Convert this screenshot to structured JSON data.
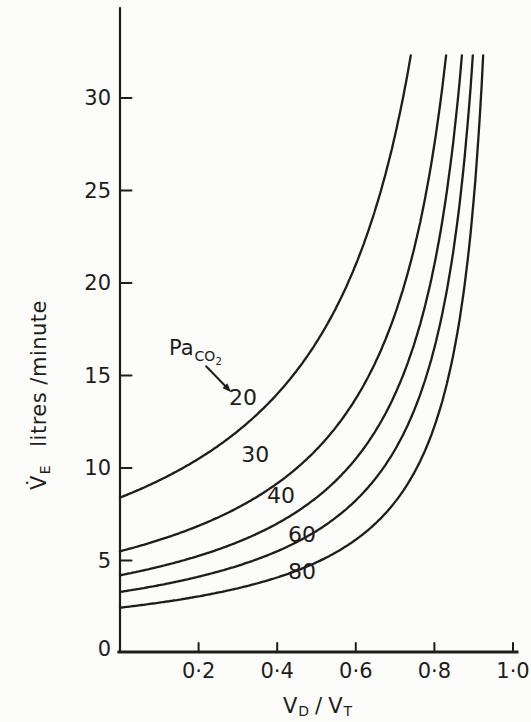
{
  "figure": {
    "background": "#fcfcfa",
    "ink_color": "#1d1d1b"
  },
  "chart_data": {
    "type": "line",
    "title": "",
    "ylabel": {
      "main": "V̇",
      "sub": "E",
      "rest": "litres /minute"
    },
    "xlabel": {
      "v1": "V",
      "sub1": "D",
      "sep": "/",
      "v2": "V",
      "sub2": "T"
    },
    "xlim": [
      0,
      1.01
    ],
    "ylim": [
      0,
      34.9
    ],
    "grid": false,
    "legend": "none",
    "origin_label": "0",
    "y_ticks": [
      {
        "v": 5,
        "label": "5"
      },
      {
        "v": 10,
        "label": "10"
      },
      {
        "v": 15,
        "label": "15"
      },
      {
        "v": 20,
        "label": "20"
      },
      {
        "v": 25,
        "label": "25"
      },
      {
        "v": 30,
        "label": "30"
      }
    ],
    "x_ticks": [
      {
        "v": 0.2,
        "label": "0·2"
      },
      {
        "v": 0.4,
        "label": "0·4"
      },
      {
        "v": 0.6,
        "label": "0·6"
      },
      {
        "v": 0.8,
        "label": "0·8"
      },
      {
        "v": 1.0,
        "label": "1·0"
      }
    ],
    "ve_max_drawn": 32.3,
    "model_note": "VE = VE0 / (1 - VD/VT); each curve clipped at ve_max_drawn",
    "series": [
      {
        "name": "PaCO2 20",
        "paco2": 20,
        "label": "20",
        "ve0": 8.4,
        "label_at": [
          0.313,
          13.8
        ],
        "points": [
          [
            0,
            8.4
          ],
          [
            0.1,
            9.3
          ],
          [
            0.2,
            10.5
          ],
          [
            0.3,
            12.0
          ],
          [
            0.4,
            14.0
          ],
          [
            0.5,
            16.8
          ],
          [
            0.6,
            21.0
          ],
          [
            0.7,
            28.0
          ],
          [
            0.74,
            32.3
          ]
        ]
      },
      {
        "name": "PaCO2 30",
        "paco2": 30,
        "label": "30",
        "ve0": 5.5,
        "label_at": [
          0.344,
          10.7
        ],
        "points": [
          [
            0,
            5.5
          ],
          [
            0.2,
            6.9
          ],
          [
            0.4,
            9.2
          ],
          [
            0.6,
            13.8
          ],
          [
            0.7,
            18.3
          ],
          [
            0.8,
            27.5
          ],
          [
            0.83,
            32.3
          ]
        ]
      },
      {
        "name": "PaCO2 40",
        "paco2": 40,
        "label": "40",
        "ve0": 4.2,
        "label_at": [
          0.41,
          8.5
        ],
        "points": [
          [
            0,
            4.2
          ],
          [
            0.2,
            5.3
          ],
          [
            0.4,
            7.0
          ],
          [
            0.6,
            10.5
          ],
          [
            0.7,
            14.0
          ],
          [
            0.8,
            21.0
          ],
          [
            0.87,
            32.3
          ]
        ]
      },
      {
        "name": "PaCO2 60",
        "paco2": 60,
        "label": "60",
        "ve0": 3.3,
        "label_at": [
          0.463,
          6.4
        ],
        "points": [
          [
            0,
            3.3
          ],
          [
            0.2,
            4.1
          ],
          [
            0.4,
            5.5
          ],
          [
            0.6,
            8.3
          ],
          [
            0.7,
            11.0
          ],
          [
            0.8,
            16.5
          ],
          [
            0.9,
            32.3
          ]
        ]
      },
      {
        "name": "PaCO2 80",
        "paco2": 80,
        "label": "80",
        "ve0": 2.45,
        "label_at": [
          0.463,
          4.4
        ],
        "points": [
          [
            0,
            2.45
          ],
          [
            0.2,
            3.1
          ],
          [
            0.4,
            4.1
          ],
          [
            0.6,
            6.1
          ],
          [
            0.7,
            8.2
          ],
          [
            0.8,
            12.3
          ],
          [
            0.92,
            32.3
          ]
        ]
      }
    ],
    "annotation": {
      "main": "Pa",
      "sub": "CO",
      "subsub": "2",
      "arrow_from": [
        0.219,
        15.5
      ],
      "arrow_to": [
        0.283,
        14.1
      ]
    }
  }
}
